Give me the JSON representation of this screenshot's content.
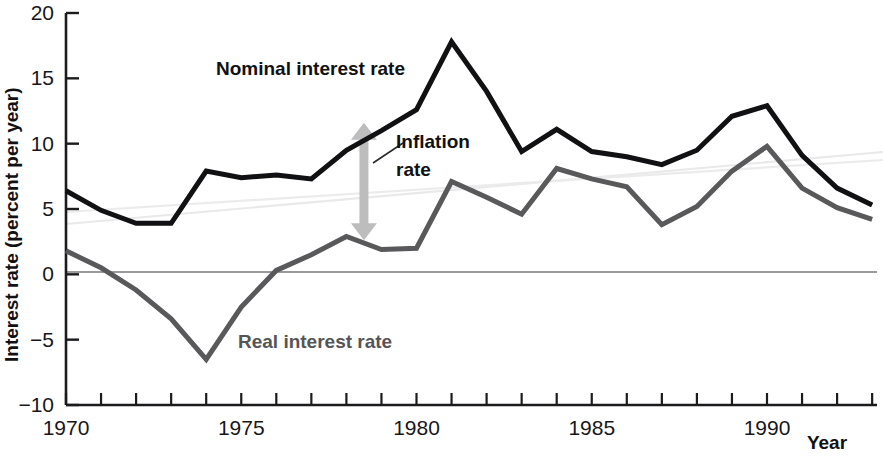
{
  "chart_data": {
    "type": "line",
    "title": "",
    "xlabel": "Year",
    "ylabel": "Interest rate (percent per year)",
    "xlim": [
      1970,
      1993
    ],
    "ylim": [
      -10,
      20
    ],
    "ytick_step": 5,
    "xtick_step": 1,
    "xtick_label_step": 5,
    "grid": false,
    "zero_line": true,
    "legend": "inline-annotations",
    "x": [
      1970,
      1971,
      1972,
      1973,
      1974,
      1975,
      1976,
      1977,
      1978,
      1979,
      1980,
      1981,
      1982,
      1983,
      1984,
      1985,
      1986,
      1987,
      1988,
      1989,
      1990,
      1991,
      1992,
      1993
    ],
    "ytick_labels": [
      "20",
      "15",
      "10",
      "5",
      "0",
      "-5",
      "-10"
    ],
    "xtick_labels": [
      "1970",
      "1975",
      "1980",
      "1985",
      "1990"
    ],
    "xtick_label_years": [
      1970,
      1975,
      1980,
      1985,
      1990
    ],
    "series": [
      {
        "name": "Nominal interest rate",
        "color": "#111114",
        "width": 5,
        "values": [
          6.4,
          4.9,
          3.9,
          3.9,
          7.9,
          7.4,
          7.6,
          7.3,
          9.5,
          11.0,
          12.6,
          17.8,
          14.0,
          9.4,
          11.1,
          9.4,
          9.0,
          8.4,
          9.5,
          12.1,
          12.9,
          9.1,
          6.6,
          5.3
        ]
      },
      {
        "name": "Real interest rate",
        "color": "#59595b",
        "width": 5,
        "values": [
          1.8,
          0.5,
          -1.2,
          -3.4,
          -6.5,
          -2.5,
          0.3,
          1.5,
          2.9,
          1.9,
          2.0,
          7.1,
          5.9,
          4.6,
          8.1,
          7.3,
          6.7,
          3.8,
          5.2,
          7.9,
          9.8,
          6.6,
          5.1,
          4.2
        ]
      }
    ],
    "annotations": [
      {
        "name": "nominal-label",
        "text": "Nominal interest rate",
        "x": 1974.8,
        "y": 14.4
      },
      {
        "name": "real-label",
        "text": "Real interest rate",
        "x": 1975.4,
        "y": -6.0
      },
      {
        "name": "inflation-label-line1",
        "text": "Inflation",
        "x": 1979.4,
        "y": 12.4
      },
      {
        "name": "inflation-label-line2",
        "text": "rate",
        "x": 1979.4,
        "y": 10.6
      },
      {
        "name": "inflation-arrow",
        "kind": "double-headed-vertical-arrow",
        "x": 1978.5,
        "y_top": 11.6,
        "y_bottom": 2.6,
        "color": "#bdbdbd"
      }
    ]
  },
  "axes": {
    "y_axis_title": "Interest rate (percent per year)",
    "x_axis_title": "Year"
  }
}
